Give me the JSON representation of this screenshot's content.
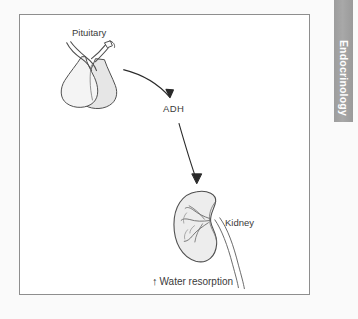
{
  "page": {
    "background_color": "#fafafa",
    "frame_border_color": "#8e8e8e",
    "frame_background": "#ffffff"
  },
  "section_tab": {
    "label": "Endocrinology",
    "background_color": "#a3a3a3",
    "text_color": "#ffffff"
  },
  "diagram": {
    "title_hidden": "",
    "labels": {
      "pituitary": "Pituitary",
      "hormone": "ADH",
      "kidney": "Kidney",
      "effect": "Water resorption",
      "effect_arrow": "↑"
    },
    "structures": [
      {
        "name": "pituitary-gland",
        "label": "Pituitary",
        "fill": "#ececec",
        "stroke": "#4a4a4a"
      },
      {
        "name": "kidney",
        "label": "Kidney",
        "fill": "#ededed",
        "stroke": "#4a4a4a"
      }
    ],
    "arrows": [
      {
        "name": "pituitary-to-adh-arrow",
        "from": "pituitary-gland",
        "to": "ADH",
        "style": "curved"
      },
      {
        "name": "adh-to-kidney-arrow",
        "from": "ADH",
        "to": "kidney",
        "style": "curved"
      }
    ]
  }
}
